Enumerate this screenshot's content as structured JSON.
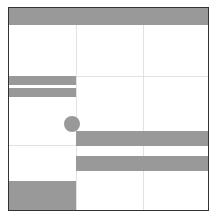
{
  "diagram": {
    "frame": {
      "x": 8,
      "y": 7,
      "width": 201,
      "height": 204,
      "border_color": "#333333"
    },
    "fill_color": "#999999",
    "grid_color": "#e2e2e2",
    "grid": {
      "columns": 3,
      "rows": 3,
      "vertical_lines_x": [
        76,
        143
      ],
      "horizontal_lines_y": [
        76,
        145
      ]
    },
    "shapes": [
      {
        "id": "header-bar",
        "type": "rect",
        "x": 9,
        "y": 8,
        "width": 199,
        "height": 17
      },
      {
        "id": "left-bar-1",
        "type": "rect",
        "x": 9,
        "y": 76,
        "width": 67,
        "height": 9
      },
      {
        "id": "left-bar-2",
        "type": "rect",
        "x": 9,
        "y": 88,
        "width": 67,
        "height": 9
      },
      {
        "id": "circle",
        "type": "circle",
        "cx": 72,
        "cy": 124,
        "r": 8
      },
      {
        "id": "right-bar-1",
        "type": "rect",
        "x": 76,
        "y": 131,
        "width": 132,
        "height": 15
      },
      {
        "id": "right-bar-2",
        "type": "rect",
        "x": 76,
        "y": 156,
        "width": 132,
        "height": 15
      },
      {
        "id": "bottom-left-block",
        "type": "rect",
        "x": 9,
        "y": 181,
        "width": 67,
        "height": 29
      }
    ]
  }
}
